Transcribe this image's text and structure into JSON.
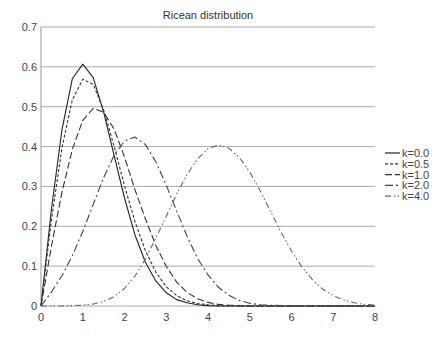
{
  "chart_data": {
    "type": "line",
    "title": "Ricean distribution",
    "xlabel": "",
    "ylabel": "",
    "xlim": [
      0,
      8
    ],
    "ylim": [
      0,
      0.7
    ],
    "x_ticks": [
      "0",
      "1",
      "2",
      "3",
      "4",
      "5",
      "6",
      "7",
      "8"
    ],
    "y_ticks": [
      "0",
      "0.1",
      "0.2",
      "0.3",
      "0.4",
      "0.5",
      "0.6",
      "0.7"
    ],
    "grid": "horizontal",
    "legend_position": "right",
    "x": [
      0,
      0.25,
      0.5,
      0.75,
      1,
      1.25,
      1.5,
      1.75,
      2,
      2.25,
      2.5,
      2.75,
      3,
      3.25,
      3.5,
      3.75,
      4,
      4.25,
      4.5,
      4.75,
      5,
      5.25,
      5.5,
      5.75,
      6,
      6.25,
      6.5,
      6.75,
      7,
      7.25,
      7.5,
      7.75,
      8
    ],
    "series": [
      {
        "name": "k=0.0",
        "dash": "",
        "color": "#222222",
        "values": [
          0,
          0.242,
          0.441,
          0.57,
          0.607,
          0.573,
          0.487,
          0.378,
          0.271,
          0.179,
          0.11,
          0.063,
          0.033,
          0.016,
          0.008,
          0.003,
          0.001,
          0,
          0,
          0,
          0,
          0,
          0,
          0,
          0,
          0,
          0,
          0,
          0,
          0,
          0,
          0,
          0
        ]
      },
      {
        "name": "k=0.5",
        "dash": "3,2",
        "color": "#333333",
        "values": [
          0,
          0.215,
          0.396,
          0.517,
          0.569,
          0.556,
          0.492,
          0.401,
          0.302,
          0.212,
          0.139,
          0.085,
          0.048,
          0.026,
          0.013,
          0.006,
          0.003,
          0.001,
          0,
          0,
          0,
          0,
          0,
          0,
          0,
          0,
          0,
          0,
          0,
          0,
          0,
          0,
          0
        ]
      },
      {
        "name": "k=1.0",
        "dash": "7,3",
        "color": "#333333",
        "values": [
          0,
          0.149,
          0.285,
          0.393,
          0.466,
          0.496,
          0.486,
          0.444,
          0.374,
          0.292,
          0.219,
          0.152,
          0.099,
          0.06,
          0.034,
          0.018,
          0.009,
          0.004,
          0.002,
          0.001,
          0,
          0,
          0,
          0,
          0,
          0,
          0,
          0,
          0,
          0,
          0,
          0,
          0
        ]
      },
      {
        "name": "k=2.0",
        "dash": "8,3,2,3",
        "color": "#444444",
        "values": [
          0,
          0.035,
          0.076,
          0.126,
          0.187,
          0.255,
          0.322,
          0.378,
          0.414,
          0.424,
          0.405,
          0.362,
          0.303,
          0.238,
          0.175,
          0.119,
          0.078,
          0.047,
          0.027,
          0.014,
          0.007,
          0.003,
          0.002,
          0.001,
          0,
          0,
          0,
          0,
          0,
          0,
          0,
          0,
          0
        ]
      },
      {
        "name": "k=4.0",
        "dash": "6,3,1.5,2,1.5,3",
        "color": "#666666",
        "values": [
          0,
          0,
          0,
          0.001,
          0.002,
          0.005,
          0.011,
          0.023,
          0.044,
          0.075,
          0.118,
          0.17,
          0.225,
          0.281,
          0.33,
          0.369,
          0.395,
          0.404,
          0.396,
          0.373,
          0.336,
          0.289,
          0.237,
          0.185,
          0.138,
          0.098,
          0.066,
          0.042,
          0.026,
          0.015,
          0.008,
          0.004,
          0.002
        ]
      }
    ]
  }
}
